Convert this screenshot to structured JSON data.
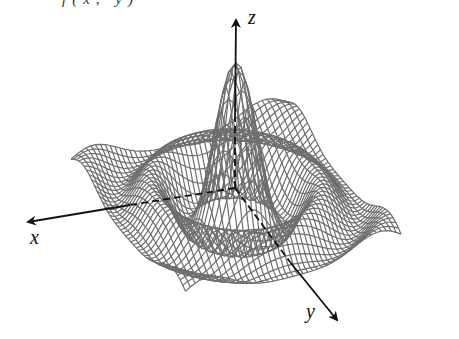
{
  "figure": {
    "type": "3d-wireframe-surface",
    "caption_fragment": "f(x, y)",
    "surface_function": "z = sin(r)/r style damped radial wave",
    "mesh_color": "#6e6e6e",
    "axis_color": "#111111",
    "background": "#ffffff"
  },
  "axes": {
    "origin_px": [
      235,
      188
    ],
    "x": {
      "label": "x",
      "tip_px": [
        28,
        222
      ],
      "label_px": [
        30,
        232
      ]
    },
    "y": {
      "label": "y",
      "tip_px": [
        337,
        320
      ],
      "label_px": [
        306,
        306
      ]
    },
    "z": {
      "label": "z",
      "tip_px": [
        236,
        20
      ],
      "label_px": [
        248,
        12
      ]
    }
  },
  "mesh": {
    "grid_n": 44,
    "range": [
      -11,
      11
    ],
    "amplitude": 150,
    "center_px": [
      236,
      190
    ]
  }
}
